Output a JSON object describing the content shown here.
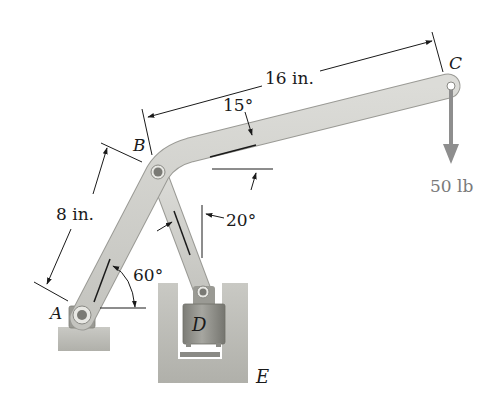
{
  "diagram": {
    "type": "mechanism",
    "points": {
      "A": "A",
      "B": "B",
      "C": "C",
      "D": "D",
      "E": "E"
    },
    "dimensions": {
      "AB_length": "8 in.",
      "BC_length": "16 in."
    },
    "angles": {
      "arm_BC": "15°",
      "link": "20°",
      "arm_AB": "60°"
    },
    "load": {
      "label": "50 lb",
      "direction": "down"
    },
    "colors": {
      "member": "#cfcfcb",
      "member_edge": "#9a9a95",
      "ground": "#bdbdb8",
      "piston": "#8d8d86",
      "force": "#8e8e8e",
      "line": "#1a1a1a"
    }
  }
}
